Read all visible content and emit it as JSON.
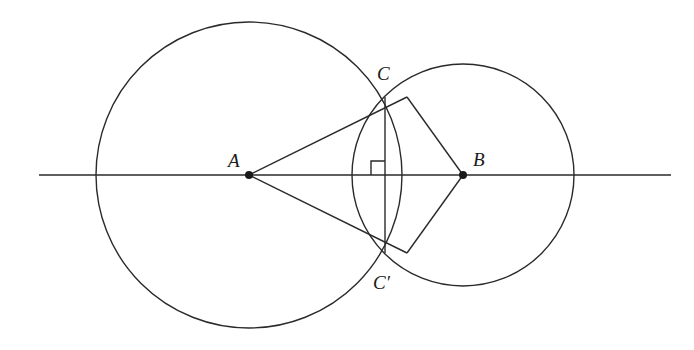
{
  "diagram": {
    "points": {
      "A": {
        "label": "A",
        "x": 249,
        "y": 175
      },
      "B": {
        "label": "B",
        "x": 463,
        "y": 175
      },
      "C": {
        "label": "C",
        "x": 407,
        "y": 97
      },
      "C_prime": {
        "label": "C′",
        "x": 407,
        "y": 253
      }
    },
    "circles": [
      {
        "name": "circle-a",
        "center": "A",
        "cx": 249,
        "cy": 175,
        "r": 153
      },
      {
        "name": "circle-b",
        "center": "B",
        "cx": 463,
        "cy": 175,
        "r": 111
      }
    ],
    "line": {
      "x1": 39,
      "y1": 175,
      "x2": 671,
      "y2": 175
    },
    "segments": [
      {
        "name": "segment-ac",
        "from": "A",
        "to": "C"
      },
      {
        "name": "segment-ac-prime",
        "from": "A",
        "to": "C_prime"
      },
      {
        "name": "segment-bc",
        "from": "B",
        "to": "C"
      },
      {
        "name": "segment-bc-prime",
        "from": "B",
        "to": "C_prime"
      },
      {
        "name": "segment-cc-prime",
        "from": "C",
        "to": "C_prime"
      }
    ],
    "right_angle_marker": {
      "x": 370,
      "y": 161,
      "size": 14
    },
    "stroke_color": "#2a2a2a",
    "background": "#ffffff"
  }
}
